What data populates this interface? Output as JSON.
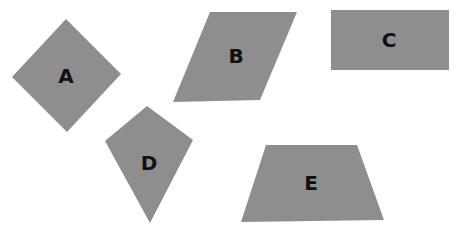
{
  "colors": {
    "shape_fill": "#8e8e8e",
    "label": "#111111",
    "background": "#ffffff"
  },
  "shapes": [
    {
      "label": "A",
      "type": "rhombus",
      "points": "66,19 121,74 67,132 12,77",
      "label_pos": [
        66,
        83
      ]
    },
    {
      "label": "B",
      "type": "parallelogram",
      "points": "210,12 297,12 260,100 173,102",
      "label_pos": [
        236,
        63
      ]
    },
    {
      "label": "C",
      "type": "rectangle",
      "points": "331,10 449,10 449,70 331,70",
      "label_pos": [
        389,
        47
      ]
    },
    {
      "label": "D",
      "type": "kite",
      "points": "147,106 193,140 150,223 105,141",
      "label_pos": [
        149,
        170
      ]
    },
    {
      "label": "E",
      "type": "trapezoid",
      "points": "266,145 357,145 384,220 241,222",
      "label_pos": [
        311,
        190
      ]
    }
  ]
}
